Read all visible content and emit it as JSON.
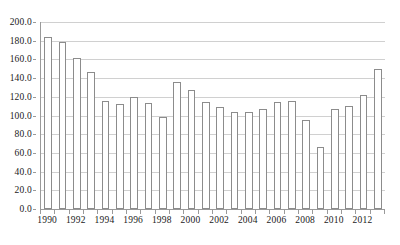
{
  "chart_data": {
    "type": "bar",
    "title": "",
    "subtitle": "",
    "xlabel": "",
    "ylabel": "",
    "categories": [
      "1990",
      "1991",
      "1992",
      "1993",
      "1994",
      "1995",
      "1996",
      "1997",
      "1998",
      "1999",
      "2000",
      "2001",
      "2002",
      "2003",
      "2004",
      "2005",
      "2006",
      "2007",
      "2008",
      "2009",
      "2010",
      "2011",
      "2012",
      "2013"
    ],
    "values": [
      184.0,
      179.0,
      161.0,
      147.0,
      115.0,
      112.0,
      120.0,
      113.0,
      98.0,
      136.0,
      127.0,
      114.0,
      109.0,
      104.0,
      104.0,
      107.0,
      114.0,
      116.0,
      95.0,
      66.0,
      107.0,
      110.0,
      122.0,
      150.0
    ],
    "ylim": [
      0.0,
      200.0
    ],
    "y_ticks": [
      "0.0",
      "20.0",
      "40.0",
      "60.0",
      "80.0",
      "100.0",
      "120.0",
      "140.0",
      "160.0",
      "180.0",
      "200.0"
    ],
    "y_tick_values": [
      0,
      20,
      40,
      60,
      80,
      100,
      120,
      140,
      160,
      180,
      200
    ],
    "x_tick_labels": [
      "1990",
      "1992",
      "1994",
      "1996",
      "1998",
      "2000",
      "2002",
      "2004",
      "2006",
      "2008",
      "2010",
      "2012"
    ],
    "grid": true,
    "legend": false,
    "legend_position": "none",
    "colors": {
      "bar_fill": "#ffffff",
      "bar_border": "#8c8c8c",
      "gridline": "#d0d0d0",
      "axis": "#9a9a9a",
      "text": "#1a1a1a",
      "background": "#ffffff"
    }
  }
}
